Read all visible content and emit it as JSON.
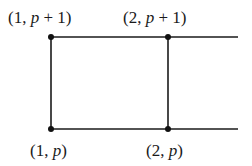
{
  "diagram": {
    "type": "lattice-grid-fragment",
    "colors": {
      "line": "#1a1a1a",
      "node": "#111111",
      "background": "#ffffff"
    },
    "nodes": [
      {
        "id": "n1",
        "label_prefix": "(1, ",
        "label_var": "p",
        "label_suffix": " + 1)",
        "x": 51,
        "y": 37,
        "label_x": 8,
        "label_y": 9
      },
      {
        "id": "n2",
        "label_prefix": "(2, ",
        "label_var": "p",
        "label_suffix": " + 1)",
        "x": 168,
        "y": 37,
        "label_x": 123,
        "label_y": 9
      },
      {
        "id": "n3",
        "label_prefix": "(1, ",
        "label_var": "p",
        "label_suffix": ")",
        "x": 51,
        "y": 129,
        "label_x": 30,
        "label_y": 142
      },
      {
        "id": "n4",
        "label_prefix": "(2, ",
        "label_var": "p",
        "label_suffix": ")",
        "x": 168,
        "y": 129,
        "label_x": 146,
        "label_y": 142
      }
    ],
    "edges": [
      {
        "from": "n1",
        "to": "n2"
      },
      {
        "from": "n2",
        "to": "open-right-top",
        "x2": 238,
        "y2": 37
      },
      {
        "from": "n3",
        "to": "n4"
      },
      {
        "from": "n4",
        "to": "open-right-bottom",
        "x2": 238,
        "y2": 129
      },
      {
        "from": "n1",
        "to": "n3"
      },
      {
        "from": "n2",
        "to": "n4"
      }
    ]
  }
}
